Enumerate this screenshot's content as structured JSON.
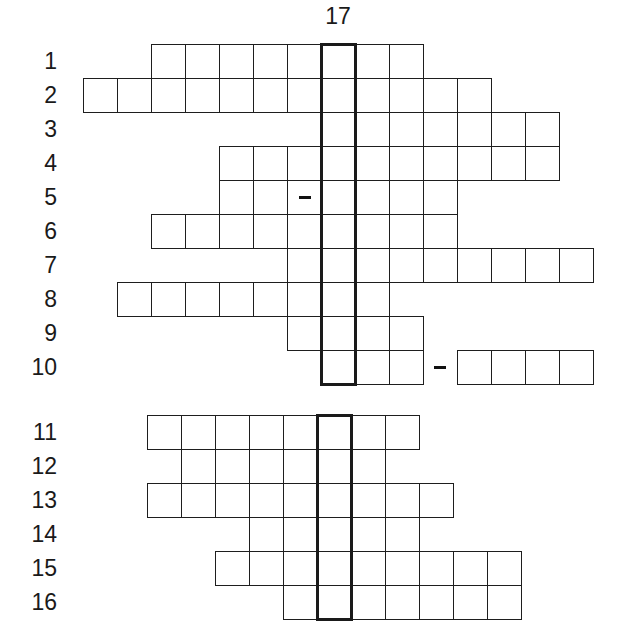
{
  "puzzle": {
    "type": "crossword-keyword",
    "keyword_column_label": "17",
    "cell_size": 34,
    "sections": [
      {
        "name": "top",
        "origin_x": 321,
        "origin_y": 44,
        "row_height": 34,
        "highlight": {
          "top": 44,
          "rows": 10
        },
        "rows": [
          {
            "label": "1",
            "start": -5,
            "end": 2
          },
          {
            "label": "2",
            "start": -7,
            "end": 4
          },
          {
            "label": "3",
            "start": 0,
            "end": 6
          },
          {
            "label": "4",
            "start": -3,
            "end": 6
          },
          {
            "label": "5",
            "start": -3,
            "end": 3,
            "dash_cells": [
              -1
            ]
          },
          {
            "label": "6",
            "start": -5,
            "end": 3
          },
          {
            "label": "7",
            "start": -1,
            "end": 7
          },
          {
            "label": "8",
            "start": -6,
            "end": 1
          },
          {
            "label": "9",
            "start": -1,
            "end": 2
          },
          {
            "label": "10",
            "start": 0,
            "end": 7,
            "gap_dash": [
              3
            ]
          }
        ]
      },
      {
        "name": "bottom",
        "origin_x": 317,
        "origin_y": 415,
        "row_height": 34,
        "highlight": {
          "top": 415,
          "rows": 6
        },
        "rows": [
          {
            "label": "11",
            "start": -5,
            "end": 2
          },
          {
            "label": "12",
            "start": -4,
            "end": 1
          },
          {
            "label": "13",
            "start": -5,
            "end": 3
          },
          {
            "label": "14",
            "start": -2,
            "end": 2
          },
          {
            "label": "15",
            "start": -3,
            "end": 5
          },
          {
            "label": "16",
            "start": -1,
            "end": 5
          }
        ]
      }
    ]
  }
}
